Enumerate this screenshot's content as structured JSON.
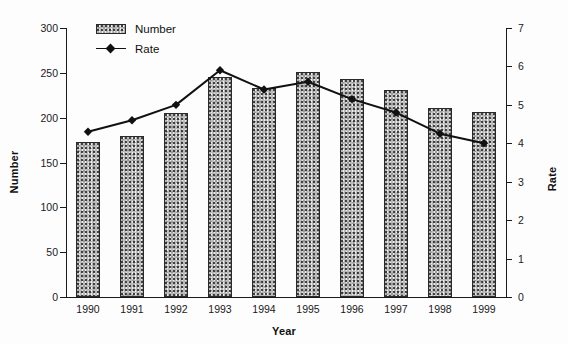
{
  "chart_data": {
    "type": "bar",
    "title": "",
    "xlabel": "Year",
    "ylabel": "Number",
    "y2label": "Rate",
    "categories": [
      "1990",
      "1991",
      "1992",
      "1993",
      "1994",
      "1995",
      "1996",
      "1997",
      "1998",
      "1999"
    ],
    "ylim": [
      0,
      300
    ],
    "yticks": [
      0,
      50,
      100,
      150,
      200,
      250,
      300
    ],
    "y2lim": [
      0,
      7
    ],
    "y2ticks": [
      0,
      1,
      2,
      3,
      4,
      5,
      6,
      7
    ],
    "grid": false,
    "legend_position": "top-left",
    "series": [
      {
        "name": "Number",
        "type": "bar",
        "axis": "left",
        "values": [
          173,
          180,
          205,
          245,
          233,
          251,
          243,
          231,
          211,
          206
        ]
      },
      {
        "name": "Rate",
        "type": "line",
        "axis": "right",
        "marker": "diamond",
        "values": [
          4.3,
          4.6,
          5.0,
          5.9,
          5.4,
          5.6,
          5.15,
          4.8,
          4.25,
          4.0
        ]
      }
    ]
  },
  "legend": {
    "items": [
      {
        "label": "Number",
        "swatch": "stipple-box"
      },
      {
        "label": "Rate",
        "swatch": "line-diamond"
      }
    ]
  },
  "axes": {
    "left_title": "Number",
    "right_title": "Rate",
    "bottom_title": "Year"
  },
  "colors": {
    "bar_fill": "#b9b9b9",
    "bar_border": "#2a2a2a",
    "line": "#111111",
    "axis": "#1a1a1a",
    "background": "#fdfdfd"
  }
}
